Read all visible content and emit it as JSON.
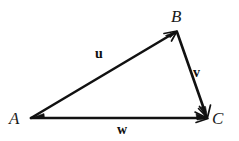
{
  "figure": {
    "type": "vector-triangle-diagram",
    "background_color": "#ffffff",
    "stroke_color": "#111111",
    "width": 239,
    "height": 141
  },
  "vertices": [
    {
      "id": "A",
      "label": "A",
      "x": 31,
      "y": 118
    },
    {
      "id": "B",
      "label": "B",
      "x": 177,
      "y": 31
    },
    {
      "id": "C",
      "label": "C",
      "x": 208,
      "y": 118
    }
  ],
  "vectors": [
    {
      "id": "u",
      "label": "u",
      "from": "A",
      "to": "B",
      "from_x": 31,
      "from_y": 118,
      "to_x": 177,
      "to_y": 31,
      "arrowhead": "end",
      "label_x": 102,
      "label_y": 54
    },
    {
      "id": "v",
      "label": "v",
      "from": "B",
      "to": "C",
      "from_x": 177,
      "from_y": 32,
      "to_x": 207,
      "to_y": 117,
      "arrowhead": "end",
      "label_x": 199,
      "label_y": 73
    },
    {
      "id": "w",
      "label": "w",
      "from": "A",
      "to": "C",
      "from_x": 31,
      "from_y": 118,
      "to_x": 207,
      "to_y": 118,
      "arrowhead": "end",
      "label_x": 123,
      "label_y": 130
    }
  ]
}
